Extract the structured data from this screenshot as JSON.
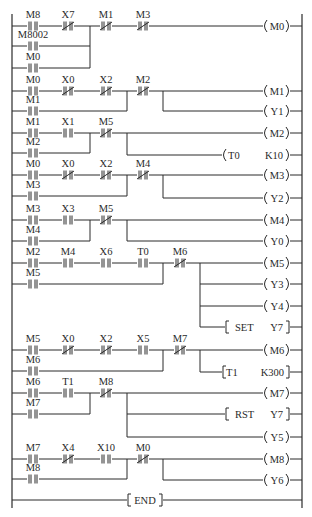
{
  "diagram": {
    "type": "PLC ladder diagram",
    "left_rail_x": 12,
    "right_rail_x": 302,
    "rungs": [
      {
        "id": "rung-1",
        "series": [
          {
            "label": "M8",
            "type": "NO"
          },
          {
            "label": "X7",
            "type": "NC"
          },
          {
            "label": "M1",
            "type": "NC"
          },
          {
            "label": "M3",
            "type": "NC"
          }
        ],
        "parallel_branches": [
          {
            "label": "M8002",
            "type": "NO"
          },
          {
            "label": "M0",
            "type": "NO"
          }
        ],
        "outputs": [
          {
            "kind": "coil",
            "label": "M0"
          }
        ]
      },
      {
        "id": "rung-2",
        "series": [
          {
            "label": "M0",
            "type": "NO"
          },
          {
            "label": "X0",
            "type": "NC"
          },
          {
            "label": "X2",
            "type": "NC"
          },
          {
            "label": "M2",
            "type": "NC"
          }
        ],
        "parallel_branches": [
          {
            "label": "M1",
            "type": "NO"
          }
        ],
        "outputs": [
          {
            "kind": "coil",
            "label": "M1"
          },
          {
            "kind": "coil",
            "label": "Y1"
          }
        ]
      },
      {
        "id": "rung-3",
        "series": [
          {
            "label": "M1",
            "type": "NO"
          },
          {
            "label": "X1",
            "type": "NO"
          },
          {
            "label": "M5",
            "type": "NC"
          }
        ],
        "parallel_branches": [
          {
            "label": "M2",
            "type": "NO"
          }
        ],
        "outputs": [
          {
            "kind": "coil",
            "label": "M2"
          },
          {
            "kind": "timer",
            "label": "T0",
            "setting": "K10"
          }
        ]
      },
      {
        "id": "rung-4",
        "series": [
          {
            "label": "M0",
            "type": "NO"
          },
          {
            "label": "X0",
            "type": "NC"
          },
          {
            "label": "X2",
            "type": "NC"
          },
          {
            "label": "M4",
            "type": "NC"
          }
        ],
        "parallel_branches": [
          {
            "label": "M3",
            "type": "NO"
          }
        ],
        "outputs": [
          {
            "kind": "coil",
            "label": "M3"
          },
          {
            "kind": "coil",
            "label": "Y2"
          }
        ]
      },
      {
        "id": "rung-5",
        "series": [
          {
            "label": "M3",
            "type": "NO"
          },
          {
            "label": "X3",
            "type": "NO"
          },
          {
            "label": "M5",
            "type": "NC"
          }
        ],
        "parallel_branches": [
          {
            "label": "M4",
            "type": "NO"
          }
        ],
        "outputs": [
          {
            "kind": "coil",
            "label": "M4"
          },
          {
            "kind": "coil",
            "label": "Y0"
          }
        ]
      },
      {
        "id": "rung-6",
        "series": [
          {
            "label": "M2",
            "type": "NO"
          },
          {
            "label": "M4",
            "type": "NO"
          },
          {
            "label": "X6",
            "type": "NO"
          },
          {
            "label": "T0",
            "type": "NO"
          },
          {
            "label": "M6",
            "type": "NC"
          }
        ],
        "parallel_branches": [
          {
            "label": "M5",
            "type": "NO"
          }
        ],
        "outputs": [
          {
            "kind": "coil",
            "label": "M5"
          },
          {
            "kind": "coil",
            "label": "Y3"
          },
          {
            "kind": "coil",
            "label": "Y4"
          },
          {
            "kind": "instruction",
            "op": "SET",
            "operand": "Y7"
          }
        ]
      },
      {
        "id": "rung-7",
        "series": [
          {
            "label": "M5",
            "type": "NO"
          },
          {
            "label": "X0",
            "type": "NC"
          },
          {
            "label": "X2",
            "type": "NC"
          },
          {
            "label": "X5",
            "type": "NO"
          },
          {
            "label": "M7",
            "type": "NC"
          }
        ],
        "parallel_branches": [
          {
            "label": "M6",
            "type": "NO"
          }
        ],
        "outputs": [
          {
            "kind": "coil",
            "label": "M6"
          },
          {
            "kind": "timer",
            "label": "T1",
            "setting": "K300"
          }
        ]
      },
      {
        "id": "rung-8",
        "series": [
          {
            "label": "M6",
            "type": "NO"
          },
          {
            "label": "T1",
            "type": "NO"
          },
          {
            "label": "M8",
            "type": "NC"
          }
        ],
        "parallel_branches": [
          {
            "label": "M7",
            "type": "NO"
          }
        ],
        "outputs": [
          {
            "kind": "coil",
            "label": "M7"
          },
          {
            "kind": "instruction",
            "op": "RST",
            "operand": "Y7"
          },
          {
            "kind": "coil",
            "label": "Y5"
          }
        ]
      },
      {
        "id": "rung-9",
        "series": [
          {
            "label": "M7",
            "type": "NO"
          },
          {
            "label": "X4",
            "type": "NC"
          },
          {
            "label": "X10",
            "type": "NO"
          },
          {
            "label": "M0",
            "type": "NC"
          }
        ],
        "parallel_branches": [
          {
            "label": "M8",
            "type": "NO"
          }
        ],
        "outputs": [
          {
            "kind": "coil",
            "label": "M8"
          },
          {
            "kind": "coil",
            "label": "Y6"
          }
        ]
      },
      {
        "id": "rung-10",
        "series": [],
        "parallel_branches": [],
        "outputs": [
          {
            "kind": "instruction",
            "op": "END"
          }
        ]
      }
    ]
  },
  "labels": {
    "r1": {
      "c1": "M8",
      "c2": "X7",
      "c3": "M1",
      "c4": "M3",
      "b1": "M8002",
      "b2": "M0",
      "o1": "M0"
    },
    "r2": {
      "c1": "M0",
      "c2": "X0",
      "c3": "X2",
      "c4": "M2",
      "b1": "M1",
      "o1": "M1",
      "o2": "Y1"
    },
    "r3": {
      "c1": "M1",
      "c2": "X1",
      "c3": "M5",
      "b1": "M2",
      "o1": "M2",
      "t_name": "T0",
      "t_set": "K10"
    },
    "r4": {
      "c1": "M0",
      "c2": "X0",
      "c3": "X2",
      "c4": "M4",
      "b1": "M3",
      "o1": "M3",
      "o2": "Y2"
    },
    "r5": {
      "c1": "M3",
      "c2": "X3",
      "c3": "M5",
      "b1": "M4",
      "o1": "M4",
      "o2": "Y0"
    },
    "r6": {
      "c1": "M2",
      "c2": "M4",
      "c3": "X6",
      "c4": "T0",
      "c5": "M6",
      "b1": "M5",
      "o1": "M5",
      "o2": "Y3",
      "o3": "Y4",
      "set_op": "SET",
      "set_arg": "Y7"
    },
    "r7": {
      "c1": "M5",
      "c2": "X0",
      "c3": "X2",
      "c4": "X5",
      "c5": "M7",
      "b1": "M6",
      "o1": "M6",
      "t_name": "T1",
      "t_set": "K300"
    },
    "r8": {
      "c1": "M6",
      "c2": "T1",
      "c3": "M8",
      "b1": "M7",
      "o1": "M7",
      "rst_op": "RST",
      "rst_arg": "Y7",
      "o3": "Y5"
    },
    "r9": {
      "c1": "M7",
      "c2": "X4",
      "c3": "X10",
      "c4": "M0",
      "b1": "M8",
      "o1": "M8",
      "o2": "Y6"
    },
    "r10": {
      "end": "END"
    }
  },
  "colors": {
    "ink": "#2a2a2a",
    "background": "#ffffff"
  }
}
